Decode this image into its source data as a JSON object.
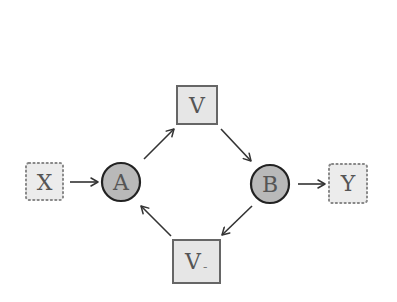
{
  "diagram": {
    "type": "causal-graph",
    "nodes": [
      {
        "id": "X",
        "label": "X",
        "shape": "dotted-square",
        "fill": "#ececec",
        "border": "#888888"
      },
      {
        "id": "A",
        "label": "A",
        "shape": "circle",
        "fill": "#b9b9b9",
        "border": "#222222"
      },
      {
        "id": "V_top",
        "label": "V",
        "shape": "square",
        "fill": "#e6e6e6",
        "border": "#666666"
      },
      {
        "id": "V_bottom",
        "label": "V",
        "subscript": "-",
        "shape": "square",
        "fill": "#e6e6e6",
        "border": "#666666"
      },
      {
        "id": "B",
        "label": "B",
        "shape": "circle",
        "fill": "#b9b9b9",
        "border": "#222222"
      },
      {
        "id": "Y",
        "label": "Y",
        "shape": "dotted-square",
        "fill": "#ececec",
        "border": "#888888"
      }
    ],
    "edges": [
      {
        "from": "X",
        "to": "A"
      },
      {
        "from": "A",
        "to": "V_top"
      },
      {
        "from": "V_top",
        "to": "B"
      },
      {
        "from": "B",
        "to": "V_bottom"
      },
      {
        "from": "V_bottom",
        "to": "A"
      },
      {
        "from": "B",
        "to": "Y"
      }
    ],
    "colors": {
      "edge": "#333333",
      "text": "#555555"
    }
  },
  "labels": {
    "x": "X",
    "a": "A",
    "v_top": "V",
    "v_bottom": "V",
    "v_bottom_sub": "-",
    "b": "B",
    "y": "Y"
  }
}
